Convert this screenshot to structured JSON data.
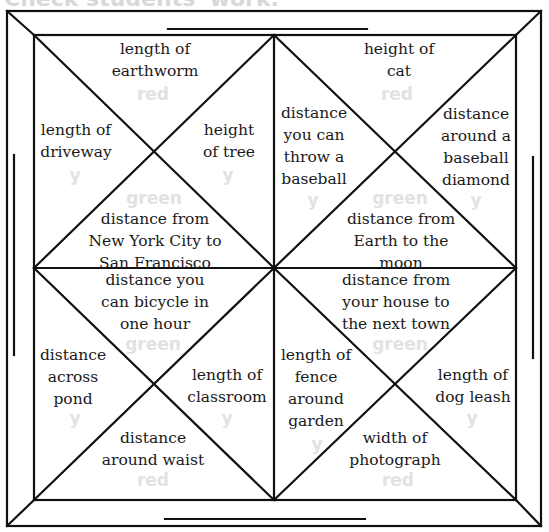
{
  "header": {
    "text": "Check students' work."
  },
  "frame": {
    "line_color": "#111111",
    "ghost_color": "#e2e2e2"
  },
  "quadrants": {
    "top_left": {
      "top": "length of\nearthworm",
      "left": "length of\ndriveway",
      "right": "height\nof tree",
      "bottom": "distance from\nNew York City to\nSan Francisco",
      "ghost": {
        "top": "red",
        "left": "y",
        "right": "y",
        "bottom": "green"
      }
    },
    "top_right": {
      "top": "height of\ncat",
      "left": "distance\nyou can\nthrow a\nbaseball",
      "right": "distance\naround a\nbaseball\ndiamond",
      "bottom": "distance from\nEarth to the\nmoon",
      "ghost": {
        "top": "red",
        "left": "y",
        "right": "y",
        "bottom": "green"
      }
    },
    "bottom_left": {
      "top": "distance you\ncan bicycle in\none hour",
      "left": "distance\nacross\npond",
      "right": "length of\nclassroom",
      "bottom": "distance\naround waist",
      "ghost": {
        "top": "green",
        "left": "y",
        "right": "y",
        "bottom": "red"
      }
    },
    "bottom_right": {
      "top": "distance from\nyour house to\nthe next town",
      "left": "length of\nfence\naround\ngarden",
      "right": "length of\ndog leash",
      "bottom": "width of\nphotograph",
      "ghost": {
        "top": "green",
        "left": "y",
        "right": "y",
        "bottom": "red"
      }
    }
  }
}
